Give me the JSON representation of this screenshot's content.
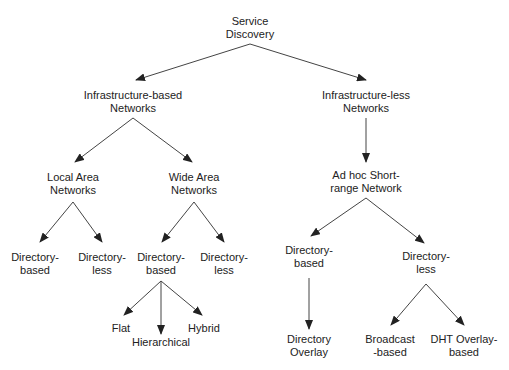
{
  "diagram": {
    "type": "tree",
    "colors": {
      "text": "#222222",
      "line": "#333333",
      "background": "#ffffff"
    },
    "nodes": {
      "root": {
        "line1": "Service",
        "line2": "Discovery"
      },
      "infra_based": {
        "line1": "Infrastructure-based",
        "line2": "Networks"
      },
      "infra_less": {
        "line1": "Infrastructure-less",
        "line2": "Networks"
      },
      "lan": {
        "line1": "Local Area",
        "line2": "Networks"
      },
      "wan": {
        "line1": "Wide Area",
        "line2": "Networks"
      },
      "lan_dir_based": {
        "line1": "Directory-",
        "line2": "based"
      },
      "lan_dir_less": {
        "line1": "Directory-",
        "line2": "less"
      },
      "wan_dir_based": {
        "line1": "Directory-",
        "line2": "based"
      },
      "wan_dir_less": {
        "line1": "Directory-",
        "line2": "less"
      },
      "flat": {
        "line1": "Flat"
      },
      "hierarchical": {
        "line1": "Hierarchical"
      },
      "hybrid": {
        "line1": "Hybrid"
      },
      "adhoc": {
        "line1": "Ad hoc Short-",
        "line2": "range Network"
      },
      "adhoc_dir_based": {
        "line1": "Directory-",
        "line2": "based"
      },
      "adhoc_dir_less": {
        "line1": "Directory-",
        "line2": "less"
      },
      "dir_overlay": {
        "line1": "Directory",
        "line2": "Overlay"
      },
      "broadcast": {
        "line1": "Broadcast",
        "line2": "-based"
      },
      "dht": {
        "line1": "DHT Overlay-",
        "line2": "based"
      }
    },
    "edges": [
      [
        "root",
        "infra_based"
      ],
      [
        "root",
        "infra_less"
      ],
      [
        "infra_based",
        "lan"
      ],
      [
        "infra_based",
        "wan"
      ],
      [
        "lan",
        "lan_dir_based"
      ],
      [
        "lan",
        "lan_dir_less"
      ],
      [
        "wan",
        "wan_dir_based"
      ],
      [
        "wan",
        "wan_dir_less"
      ],
      [
        "wan_dir_based",
        "flat"
      ],
      [
        "wan_dir_based",
        "hierarchical"
      ],
      [
        "wan_dir_based",
        "hybrid"
      ],
      [
        "infra_less",
        "adhoc"
      ],
      [
        "adhoc",
        "adhoc_dir_based"
      ],
      [
        "adhoc",
        "adhoc_dir_less"
      ],
      [
        "adhoc_dir_based",
        "dir_overlay"
      ],
      [
        "adhoc_dir_less",
        "broadcast"
      ],
      [
        "adhoc_dir_less",
        "dht"
      ]
    ]
  }
}
